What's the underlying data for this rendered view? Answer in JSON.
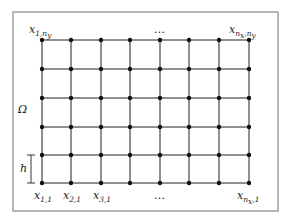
{
  "diagram": {
    "domain_label": "Ω",
    "spacing_label": "h",
    "corner_labels": {
      "top_left": {
        "base": "x",
        "sub": "1,n",
        "subsub": "y"
      },
      "top_right": {
        "base": "x",
        "sub": "n",
        "subsub": "x",
        "sub2": ",n",
        "subsub2": "y"
      },
      "bottom_right": {
        "base": "x",
        "sub": "n",
        "subsub": "x",
        "sub2": ",1"
      }
    },
    "bottom_labels": [
      {
        "base": "x",
        "sub": "1,1"
      },
      {
        "base": "x",
        "sub": "2,1"
      },
      {
        "base": "x",
        "sub": "3,1"
      }
    ],
    "ellipsis_top": "…",
    "ellipsis_bottom": "…",
    "grid": {
      "columns_x": [
        42,
        71,
        101,
        130,
        160,
        189,
        219,
        249
      ],
      "rows_y": [
        40,
        69,
        98,
        127,
        155,
        183
      ]
    },
    "colors": {
      "frame": "#888888",
      "grid": "#222222",
      "node": "#111111"
    }
  }
}
